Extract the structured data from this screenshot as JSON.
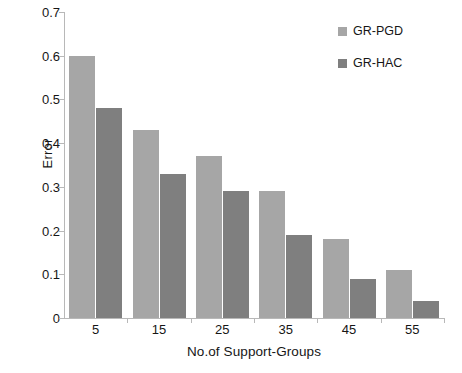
{
  "chart_data": {
    "type": "bar",
    "title": "",
    "subtitle": "",
    "xlabel": "No.of Support-Groups",
    "ylabel": "Error",
    "categories": [
      "5",
      "15",
      "25",
      "35",
      "45",
      "55"
    ],
    "series": [
      {
        "name": "GR-PGD",
        "color": "#a6a6a6",
        "values": [
          0.6,
          0.43,
          0.37,
          0.29,
          0.18,
          0.11
        ]
      },
      {
        "name": "GR-HAC",
        "color": "#7f7f7f",
        "values": [
          0.48,
          0.33,
          0.29,
          0.19,
          0.09,
          0.04
        ]
      }
    ],
    "ylim": [
      0,
      0.7
    ],
    "ytick_labels": [
      "0.7",
      "0.6",
      "0.5",
      "0.4",
      "0.3",
      "0.2",
      "0.1",
      "0"
    ],
    "ytick_values": [
      0.7,
      0.6,
      0.5,
      0.4,
      0.3,
      0.2,
      0.1,
      0
    ],
    "grid": false,
    "legend_position": "top-right",
    "background": "#ffffff",
    "axis_color": "#b8b8b8"
  }
}
